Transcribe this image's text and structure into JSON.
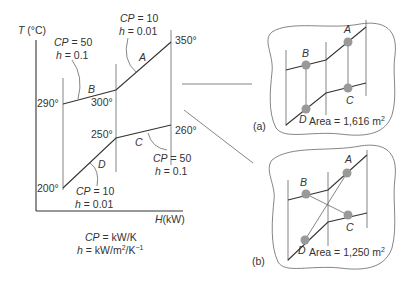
{
  "main": {
    "y_axis_label": "T (°C)",
    "x_axis_label": "H (kW)",
    "temps": {
      "t290": "290°",
      "t300": "300°",
      "t350": "350°",
      "t250": "250°",
      "t260": "260°",
      "t200": "200°"
    },
    "streams": {
      "A": {
        "label": "A",
        "cp": "CP = 10",
        "h": "h = 0.01"
      },
      "B": {
        "label": "B",
        "cp": "CP = 50",
        "h": "h = 0.1"
      },
      "C": {
        "label": "C",
        "cp": "CP = 50",
        "h": "h = 0.1"
      },
      "D": {
        "label": "D",
        "cp": "CP = 10",
        "h": "h = 0.01"
      }
    },
    "units": {
      "cp_unit": "CP = kW/K",
      "h_unit": "h = kW/m²/K⁻¹"
    }
  },
  "panel_a": {
    "tag": "(a)",
    "labels": {
      "A": "A",
      "B": "B",
      "C": "C",
      "D": "D"
    },
    "area": "Area = 1,616 m²"
  },
  "panel_b": {
    "tag": "(b)",
    "labels": {
      "A": "A",
      "B": "B",
      "C": "C",
      "D": "D"
    },
    "area": "Area = 1,250 m²"
  }
}
